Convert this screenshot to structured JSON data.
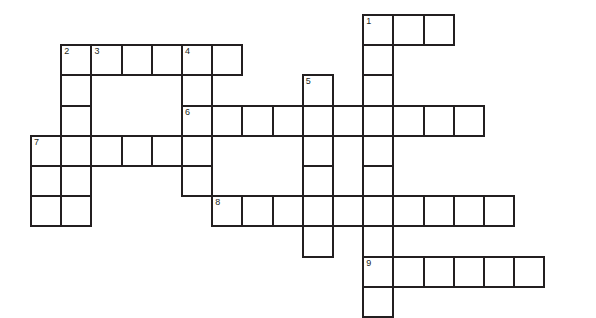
{
  "puzzle": {
    "title": "Crossword Grid",
    "grid": {
      "origin_x": 30,
      "origin_y": 14,
      "cell_size": 30.2,
      "cell_border_px": 2,
      "border_color": "#231f20",
      "cell_fill": "#ffffff",
      "background": "#ffffff",
      "columns": 18,
      "rows": 11
    },
    "entries": [
      {
        "number": "1",
        "direction": "across",
        "row": 0,
        "col": 11,
        "length": 3
      },
      {
        "number": "1",
        "direction": "down",
        "row": 0,
        "col": 11,
        "length": 11
      },
      {
        "number": "2",
        "direction": "down",
        "row": 1,
        "col": 1,
        "length": 6
      },
      {
        "number": "3",
        "direction": "across",
        "row": 1,
        "col": 2,
        "length": 5
      },
      {
        "number": "4",
        "direction": "down",
        "row": 1,
        "col": 5,
        "length": 6
      },
      {
        "number": "5",
        "direction": "down",
        "row": 2,
        "col": 9,
        "length": 7
      },
      {
        "number": "6",
        "direction": "across",
        "row": 3,
        "col": 5,
        "length": 10
      },
      {
        "number": "7",
        "direction": "across",
        "row": 4,
        "col": 0,
        "length": 6
      },
      {
        "number": "8",
        "direction": "across",
        "row": 6,
        "col": 6,
        "length": 10
      },
      {
        "number": "9",
        "direction": "across",
        "row": 8,
        "col": 11,
        "length": 6
      }
    ],
    "cells": [
      {
        "row": 0,
        "col": 11,
        "number": "1"
      },
      {
        "row": 0,
        "col": 12,
        "number": ""
      },
      {
        "row": 0,
        "col": 13,
        "number": ""
      },
      {
        "row": 1,
        "col": 1,
        "number": "2"
      },
      {
        "row": 1,
        "col": 2,
        "number": "3"
      },
      {
        "row": 1,
        "col": 3,
        "number": ""
      },
      {
        "row": 1,
        "col": 4,
        "number": ""
      },
      {
        "row": 1,
        "col": 5,
        "number": "4"
      },
      {
        "row": 1,
        "col": 6,
        "number": ""
      },
      {
        "row": 1,
        "col": 11,
        "number": ""
      },
      {
        "row": 2,
        "col": 1,
        "number": ""
      },
      {
        "row": 2,
        "col": 5,
        "number": ""
      },
      {
        "row": 2,
        "col": 9,
        "number": "5"
      },
      {
        "row": 2,
        "col": 11,
        "number": ""
      },
      {
        "row": 3,
        "col": 1,
        "number": ""
      },
      {
        "row": 3,
        "col": 5,
        "number": "6"
      },
      {
        "row": 3,
        "col": 6,
        "number": ""
      },
      {
        "row": 3,
        "col": 7,
        "number": ""
      },
      {
        "row": 3,
        "col": 8,
        "number": ""
      },
      {
        "row": 3,
        "col": 9,
        "number": ""
      },
      {
        "row": 3,
        "col": 10,
        "number": ""
      },
      {
        "row": 3,
        "col": 11,
        "number": ""
      },
      {
        "row": 3,
        "col": 12,
        "number": ""
      },
      {
        "row": 3,
        "col": 13,
        "number": ""
      },
      {
        "row": 3,
        "col": 14,
        "number": ""
      },
      {
        "row": 4,
        "col": 0,
        "number": "7"
      },
      {
        "row": 4,
        "col": 1,
        "number": ""
      },
      {
        "row": 4,
        "col": 2,
        "number": ""
      },
      {
        "row": 4,
        "col": 3,
        "number": ""
      },
      {
        "row": 4,
        "col": 4,
        "number": ""
      },
      {
        "row": 4,
        "col": 5,
        "number": ""
      },
      {
        "row": 4,
        "col": 9,
        "number": ""
      },
      {
        "row": 4,
        "col": 11,
        "number": ""
      },
      {
        "row": 5,
        "col": 0,
        "number": ""
      },
      {
        "row": 5,
        "col": 1,
        "number": ""
      },
      {
        "row": 5,
        "col": 5,
        "number": ""
      },
      {
        "row": 5,
        "col": 9,
        "number": ""
      },
      {
        "row": 5,
        "col": 11,
        "number": ""
      },
      {
        "row": 6,
        "col": 0,
        "number": ""
      },
      {
        "row": 6,
        "col": 1,
        "number": ""
      },
      {
        "row": 6,
        "col": 6,
        "number": "8"
      },
      {
        "row": 6,
        "col": 7,
        "number": ""
      },
      {
        "row": 6,
        "col": 8,
        "number": ""
      },
      {
        "row": 6,
        "col": 9,
        "number": ""
      },
      {
        "row": 6,
        "col": 10,
        "number": ""
      },
      {
        "row": 6,
        "col": 11,
        "number": ""
      },
      {
        "row": 6,
        "col": 12,
        "number": ""
      },
      {
        "row": 6,
        "col": 13,
        "number": ""
      },
      {
        "row": 6,
        "col": 14,
        "number": ""
      },
      {
        "row": 6,
        "col": 15,
        "number": ""
      },
      {
        "row": 7,
        "col": 9,
        "number": ""
      },
      {
        "row": 7,
        "col": 11,
        "number": ""
      },
      {
        "row": 8,
        "col": 11,
        "number": "9"
      },
      {
        "row": 8,
        "col": 12,
        "number": ""
      },
      {
        "row": 8,
        "col": 13,
        "number": ""
      },
      {
        "row": 8,
        "col": 14,
        "number": ""
      },
      {
        "row": 8,
        "col": 15,
        "number": ""
      },
      {
        "row": 8,
        "col": 16,
        "number": ""
      },
      {
        "row": 9,
        "col": 11,
        "number": ""
      }
    ]
  }
}
